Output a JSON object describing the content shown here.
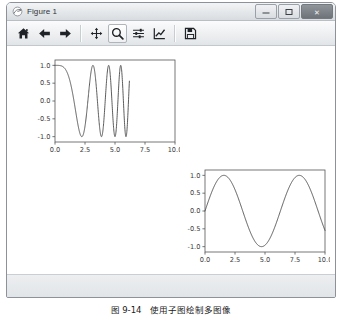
{
  "window": {
    "title": "Figure 1",
    "title_icon": "matplotlib-figure-icon",
    "controls": {
      "minimize_label": "–",
      "maximize_label": "□",
      "close_label": "✕"
    }
  },
  "toolbar": {
    "items": [
      {
        "name": "home-icon",
        "tooltip": "Home",
        "active": false
      },
      {
        "name": "back-arrow-icon",
        "tooltip": "Back",
        "active": false
      },
      {
        "name": "forward-arrow-icon",
        "tooltip": "Forward",
        "active": false
      },
      {
        "name": "pan-move-icon",
        "tooltip": "Pan",
        "active": false
      },
      {
        "name": "zoom-magnifier-icon",
        "tooltip": "Zoom to rectangle",
        "active": true
      },
      {
        "name": "configure-subplots-icon",
        "tooltip": "Configure subplots",
        "active": false
      },
      {
        "name": "edit-axis-curve-icon",
        "tooltip": "Edit axis",
        "active": false
      },
      {
        "name": "save-floppy-icon",
        "tooltip": "Save the figure",
        "active": false
      }
    ]
  },
  "caption": {
    "text": "图 9-14　使用子图绘制多图像"
  },
  "colors": {
    "line": "#4a4a4a",
    "axes_frame": "#555555",
    "tick_label": "#3a3a3a",
    "canvas_bg": "#ffffff"
  },
  "chart_data": [
    {
      "id": "chirp-plot",
      "type": "line",
      "title": "",
      "xlabel": "",
      "ylabel": "",
      "xlim": [
        0,
        10
      ],
      "ylim": [
        -1.15,
        1.15
      ],
      "xticks": [
        "0.0",
        "2.5",
        "5.0",
        "7.5",
        "10.0"
      ],
      "xtick_values": [
        0.0,
        2.5,
        5.0,
        7.5,
        10.0
      ],
      "yticks": [
        "1.0",
        "0.5",
        "0.0",
        "-0.5",
        "-1.0"
      ],
      "ytick_values": [
        1.0,
        0.5,
        0.0,
        -0.5,
        -1.0
      ],
      "grid": false,
      "legend": null,
      "series": [
        {
          "name": "chirp",
          "formula": "cos(2*pi*t*t/10)",
          "x_start": 0.0,
          "x_end": 6.2,
          "n_points": 620,
          "description": "cosine chirp, frequency increasing with t, amplitude 1.0, drawn only over 0 to 6.2"
        }
      ]
    },
    {
      "id": "sine-plot",
      "type": "line",
      "title": "",
      "xlabel": "",
      "ylabel": "",
      "xlim": [
        0,
        10
      ],
      "ylim": [
        -1.15,
        1.15
      ],
      "xticks": [
        "0.0",
        "2.5",
        "5.0",
        "7.5",
        "10.0"
      ],
      "xtick_values": [
        0.0,
        2.5,
        5.0,
        7.5,
        10.0
      ],
      "yticks": [
        "1.0",
        "0.5",
        "0.0",
        "-0.5",
        "-1.0"
      ],
      "ytick_values": [
        1.0,
        0.5,
        0.0,
        -0.5,
        -1.0
      ],
      "grid": false,
      "legend": null,
      "series": [
        {
          "name": "sine",
          "formula": "sin(t)",
          "x_start": 0.0,
          "x_end": 10.0,
          "n_points": 400,
          "description": "sine wave, peak 1.0 near t=1.57, trough -1.0 near t=4.71, peak 1.0 near t=7.85, ends about -0.54 at t=10"
        }
      ]
    }
  ]
}
